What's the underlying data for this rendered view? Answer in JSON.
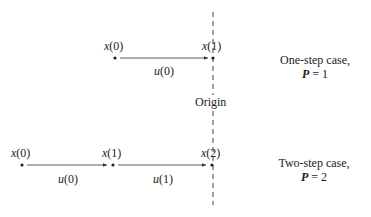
{
  "diagram": {
    "origin_label": "Origin",
    "one_step": {
      "points": [
        {
          "var": "x",
          "index": "(0)"
        },
        {
          "var": "x",
          "index": "(1)"
        }
      ],
      "controls": [
        {
          "var": "u",
          "index": "(0)"
        }
      ],
      "caption_line1": "One-step case,",
      "caption_P": "P",
      "caption_eq": " = 1"
    },
    "two_step": {
      "points": [
        {
          "var": "x",
          "index": "(0)"
        },
        {
          "var": "x",
          "index": "(1)"
        },
        {
          "var": "x",
          "index": "(2)"
        }
      ],
      "controls": [
        {
          "var": "u",
          "index": "(0)"
        },
        {
          "var": "u",
          "index": "(1)"
        }
      ],
      "caption_line1": "Two-step case,",
      "caption_P": "P",
      "caption_eq": " = 2"
    },
    "colors": {
      "line": "#333333",
      "dashed_axis": "#444444"
    }
  }
}
